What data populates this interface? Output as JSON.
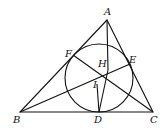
{
  "diagram": {
    "type": "geometry",
    "points": {
      "A": {
        "label": "A",
        "x": 107,
        "y": 20
      },
      "B": {
        "label": "B",
        "x": 20,
        "y": 112
      },
      "C": {
        "label": "C",
        "x": 153,
        "y": 112
      },
      "D": {
        "label": "D",
        "x": 99,
        "y": 112
      },
      "E": {
        "label": "E",
        "x": 130,
        "y": 64
      },
      "F": {
        "label": "F",
        "x": 73,
        "y": 55
      },
      "H": {
        "label": "H",
        "x": 108,
        "y": 70
      },
      "I": {
        "label": "I",
        "x": 99,
        "y": 78
      }
    },
    "circle": {
      "cx": 99,
      "cy": 78,
      "r": 34
    },
    "label_positions": {
      "A": {
        "x": 104,
        "y": 15
      },
      "B": {
        "x": 13,
        "y": 123
      },
      "C": {
        "x": 150,
        "y": 123
      },
      "D": {
        "x": 94,
        "y": 123
      },
      "E": {
        "x": 129,
        "y": 63
      },
      "F": {
        "x": 65,
        "y": 57
      },
      "H": {
        "x": 98,
        "y": 67
      },
      "I": {
        "x": 93,
        "y": 88
      }
    }
  }
}
